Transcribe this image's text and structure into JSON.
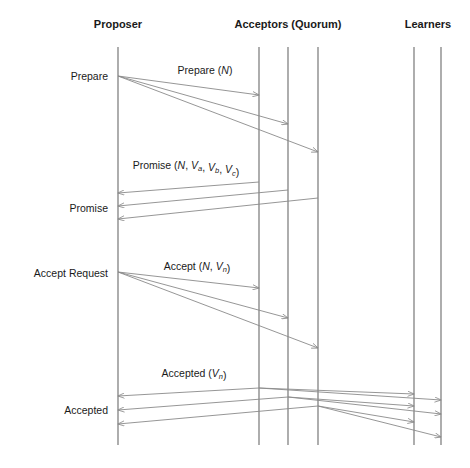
{
  "diagram": {
    "type": "sequence-diagram",
    "width": 470,
    "height": 468,
    "colors": {
      "background": "#ffffff",
      "lifeline": "#6b6b6b",
      "message": "#8a8a8a",
      "text": "#1a1a1a"
    },
    "actor_groups": [
      {
        "id": "proposer",
        "label": "Proposer",
        "label_x": 118,
        "label_y": 28,
        "lifelines": [
          118
        ]
      },
      {
        "id": "acceptors",
        "label": "Acceptors (Quorum)",
        "label_x": 288,
        "label_y": 28,
        "lifelines": [
          259,
          288,
          318
        ]
      },
      {
        "id": "learners",
        "label": "Learners",
        "label_x": 428,
        "label_y": 28,
        "lifelines": [
          414,
          441
        ]
      }
    ],
    "lifeline_top": 47,
    "lifeline_bottom": 445,
    "stage_labels": [
      {
        "id": "prepare",
        "text": "Prepare",
        "x": 108,
        "y": 80
      },
      {
        "id": "promise",
        "text": "Promise",
        "x": 108,
        "y": 212
      },
      {
        "id": "accept-request",
        "text": "Accept Request",
        "x": 108,
        "y": 277
      },
      {
        "id": "accepted",
        "text": "Accepted",
        "x": 108,
        "y": 414
      }
    ],
    "message_labels": [
      {
        "id": "prepare-msg",
        "x": 205,
        "y": 74,
        "parts": [
          {
            "text": "Prepare (",
            "style": "normal"
          },
          {
            "text": "N",
            "style": "italic"
          },
          {
            "text": ")",
            "style": "normal"
          }
        ]
      },
      {
        "id": "promise-msg",
        "x": 186,
        "y": 169,
        "parts": [
          {
            "text": "Promise (",
            "style": "normal"
          },
          {
            "text": "N",
            "style": "italic"
          },
          {
            "text": ", ",
            "style": "normal"
          },
          {
            "text": "V",
            "style": "italic"
          },
          {
            "text": "a",
            "style": "subscript"
          },
          {
            "text": ", ",
            "style": "normal"
          },
          {
            "text": "V",
            "style": "italic"
          },
          {
            "text": "b",
            "style": "subscript"
          },
          {
            "text": ", ",
            "style": "normal"
          },
          {
            "text": "V",
            "style": "italic"
          },
          {
            "text": "c",
            "style": "subscript"
          },
          {
            "text": ")",
            "style": "normal"
          }
        ]
      },
      {
        "id": "accept-msg",
        "x": 197,
        "y": 270,
        "parts": [
          {
            "text": "Accept (",
            "style": "normal"
          },
          {
            "text": "N",
            "style": "italic"
          },
          {
            "text": ", ",
            "style": "normal"
          },
          {
            "text": "V",
            "style": "italic"
          },
          {
            "text": "n",
            "style": "subscript"
          },
          {
            "text": ")",
            "style": "normal"
          }
        ]
      },
      {
        "id": "accepted-msg",
        "x": 194,
        "y": 377,
        "parts": [
          {
            "text": "Accepted (",
            "style": "normal"
          },
          {
            "text": "V",
            "style": "italic"
          },
          {
            "text": "n",
            "style": "subscript"
          },
          {
            "text": ")",
            "style": "normal"
          }
        ]
      }
    ],
    "messages": [
      {
        "id": "prepare-1",
        "group": "prepare",
        "from": "proposer",
        "to": "acceptor-1",
        "x1": 118,
        "y1": 76,
        "x2": 259,
        "y2": 95
      },
      {
        "id": "prepare-2",
        "group": "prepare",
        "from": "proposer",
        "to": "acceptor-2",
        "x1": 118,
        "y1": 76,
        "x2": 288,
        "y2": 124
      },
      {
        "id": "prepare-3",
        "group": "prepare",
        "from": "proposer",
        "to": "acceptor-3",
        "x1": 118,
        "y1": 76,
        "x2": 318,
        "y2": 152
      },
      {
        "id": "promise-1",
        "group": "promise",
        "from": "acceptor-1",
        "to": "proposer",
        "x1": 259,
        "y1": 182,
        "x2": 118,
        "y2": 193
      },
      {
        "id": "promise-2",
        "group": "promise",
        "from": "acceptor-2",
        "to": "proposer",
        "x1": 288,
        "y1": 190,
        "x2": 118,
        "y2": 206
      },
      {
        "id": "promise-3",
        "group": "promise",
        "from": "acceptor-3",
        "to": "proposer",
        "x1": 318,
        "y1": 198,
        "x2": 118,
        "y2": 219
      },
      {
        "id": "accept-1",
        "group": "accept-request",
        "from": "proposer",
        "to": "acceptor-1",
        "x1": 118,
        "y1": 272,
        "x2": 259,
        "y2": 288
      },
      {
        "id": "accept-2",
        "group": "accept-request",
        "from": "proposer",
        "to": "acceptor-2",
        "x1": 118,
        "y1": 272,
        "x2": 288,
        "y2": 318
      },
      {
        "id": "accept-3",
        "group": "accept-request",
        "from": "proposer",
        "to": "acceptor-3",
        "x1": 118,
        "y1": 272,
        "x2": 318,
        "y2": 348
      },
      {
        "id": "accepted-a1-proposer",
        "group": "accepted",
        "from": "acceptor-1",
        "to": "proposer",
        "x1": 259,
        "y1": 388,
        "x2": 118,
        "y2": 396
      },
      {
        "id": "accepted-a2-proposer",
        "group": "accepted",
        "from": "acceptor-2",
        "to": "proposer",
        "x1": 288,
        "y1": 397,
        "x2": 118,
        "y2": 410
      },
      {
        "id": "accepted-a3-proposer",
        "group": "accepted",
        "from": "acceptor-3",
        "to": "proposer",
        "x1": 318,
        "y1": 406,
        "x2": 118,
        "y2": 424
      },
      {
        "id": "accepted-a1-learner1",
        "group": "accepted",
        "from": "acceptor-1",
        "to": "learner-1",
        "x1": 259,
        "y1": 388,
        "x2": 414,
        "y2": 394
      },
      {
        "id": "accepted-a1-learner2",
        "group": "accepted",
        "from": "acceptor-1",
        "to": "learner-2",
        "x1": 259,
        "y1": 388,
        "x2": 441,
        "y2": 400
      },
      {
        "id": "accepted-a2-learner1",
        "group": "accepted",
        "from": "acceptor-2",
        "to": "learner-1",
        "x1": 288,
        "y1": 397,
        "x2": 414,
        "y2": 406
      },
      {
        "id": "accepted-a2-learner2",
        "group": "accepted",
        "from": "acceptor-2",
        "to": "learner-2",
        "x1": 288,
        "y1": 397,
        "x2": 441,
        "y2": 414
      },
      {
        "id": "accepted-a3-learner1",
        "group": "accepted",
        "from": "acceptor-3",
        "to": "learner-1",
        "x1": 318,
        "y1": 406,
        "x2": 414,
        "y2": 422
      },
      {
        "id": "accepted-a3-learner2",
        "group": "accepted",
        "from": "acceptor-3",
        "to": "learner-2",
        "x1": 318,
        "y1": 406,
        "x2": 441,
        "y2": 437
      }
    ]
  }
}
